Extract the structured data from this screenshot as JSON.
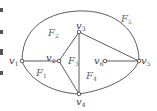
{
  "diagram": {
    "type": "planar-graph",
    "vertices": [
      {
        "id": "v1",
        "symbol": "v",
        "sub": "1",
        "x": 22,
        "y": 61
      },
      {
        "id": "v2",
        "symbol": "v",
        "sub": "2",
        "x": 59,
        "y": 61
      },
      {
        "id": "v3",
        "symbol": "v",
        "sub": "3",
        "x": 79,
        "y": 32
      },
      {
        "id": "v4",
        "symbol": "v",
        "sub": "4",
        "x": 79,
        "y": 94
      },
      {
        "id": "v5",
        "symbol": "v",
        "sub": "5",
        "x": 139,
        "y": 61
      },
      {
        "id": "v6",
        "symbol": "v",
        "sub": "6",
        "x": 105,
        "y": 61
      }
    ],
    "edges": [
      [
        "v1",
        "v2"
      ],
      [
        "v2",
        "v3"
      ],
      [
        "v2",
        "v4"
      ],
      [
        "v3",
        "v4"
      ],
      [
        "v3",
        "v5"
      ],
      [
        "v6",
        "v5"
      ],
      [
        "v1",
        "v5",
        "outer-arc-top"
      ],
      [
        "v1",
        "v4",
        "lower-arc"
      ],
      [
        "v4",
        "v5",
        "lower-arc"
      ]
    ],
    "faces": [
      {
        "id": "F1",
        "symbol": "F",
        "sub": "1",
        "x": 34,
        "y": 70
      },
      {
        "id": "F2",
        "symbol": "F",
        "sub": "2",
        "x": 48,
        "y": 30
      },
      {
        "id": "F3",
        "symbol": "F",
        "sub": "3",
        "x": 68,
        "y": 58
      },
      {
        "id": "F4",
        "symbol": "F",
        "sub": "4",
        "x": 87,
        "y": 72
      },
      {
        "id": "F5",
        "symbol": "F",
        "sub": "5",
        "x": 121,
        "y": 15
      }
    ],
    "colors": {
      "stroke": "#333333",
      "label": "#444444",
      "vertex_fill": "#ffffff"
    }
  }
}
